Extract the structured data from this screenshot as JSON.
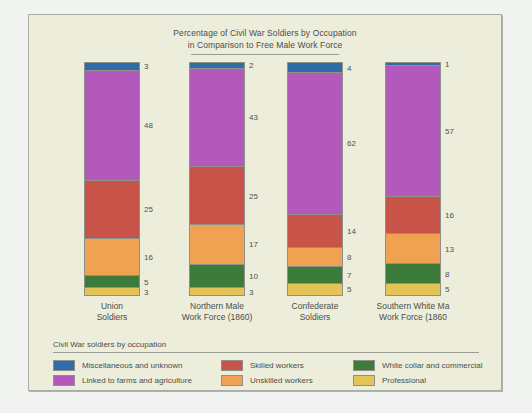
{
  "chart_data": {
    "type": "bar",
    "subtype": "stacked-100-percent",
    "title": "Percentage of Civil War Soldiers by Occupation in Comparison to Free Male Work Force",
    "title_lines": [
      "Percentage of Civil War Soldiers by Occupation",
      "in Comparison to Free Male Work Force"
    ],
    "xlabel": "",
    "ylabel": "",
    "ylim": [
      0,
      100
    ],
    "grid": false,
    "legend_position": "bottom",
    "legend_title": "Civil War soldiers by occupation",
    "categories": [
      "Union Soldiers",
      "Northern Male Work Force (1860)",
      "Confederate Soldiers",
      "Southern White Ma Work Force (1860"
    ],
    "category_lines": [
      [
        "Union",
        "Soldiers"
      ],
      [
        "Northern Male",
        "Work Force (1860)"
      ],
      [
        "Confederate",
        "Soldiers"
      ],
      [
        "Southern White Ma",
        "Work Force (1860"
      ]
    ],
    "series": [
      {
        "name": "Miscellaneous and unknown",
        "color": "#2f6ca8",
        "values": [
          3,
          2,
          4,
          1
        ]
      },
      {
        "name": "Linked to farms and agriculture",
        "color": "#b259bb",
        "values": [
          48,
          43,
          62,
          57
        ]
      },
      {
        "name": "Skilled workers",
        "color": "#c75349",
        "values": [
          25,
          25,
          14,
          16
        ]
      },
      {
        "name": "Unskilled workers",
        "color": "#efa251",
        "values": [
          16,
          17,
          8,
          13
        ]
      },
      {
        "name": "White collar and commercial",
        "color": "#3c7b39",
        "values": [
          5,
          10,
          7,
          8
        ]
      },
      {
        "name": "Professional",
        "color": "#e4c457",
        "values": [
          3,
          3,
          5,
          5
        ]
      }
    ],
    "legend_entries": [
      {
        "label": "Miscellaneous and unknown",
        "color": "#2f6ca8"
      },
      {
        "label": "Skilled workers",
        "color": "#c75349"
      },
      {
        "label": "White collar and commercial",
        "color": "#3c7b39"
      },
      {
        "label": "Linked to farms and agriculture",
        "color": "#b259bb"
      },
      {
        "label": "Unskilled workers",
        "color": "#efa251"
      },
      {
        "label": "Professional",
        "color": "#e4c457"
      }
    ]
  }
}
